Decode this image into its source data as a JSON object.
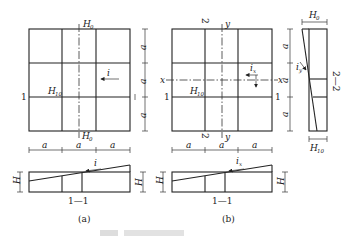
{
  "diagram": {
    "panel_a": {
      "label": "(a)",
      "plan_labels": {
        "top": "H",
        "top_sub": "0",
        "bottom": "H",
        "bottom_sub": "0",
        "center": "H",
        "center_sub": "10",
        "slope": "i",
        "section_mark": "1"
      },
      "dimension": "a",
      "section": {
        "title": "1—1",
        "left": "H",
        "left_sub": "10",
        "right": "H",
        "right_sub": "0",
        "slope": "i"
      }
    },
    "panel_b": {
      "label": "(b)",
      "plan_labels": {
        "axis_x": "x",
        "axis_y": "y",
        "section2": "2",
        "section1": "1",
        "center": "H",
        "center_sub": "10",
        "slope": "i",
        "slope_sub": "x"
      },
      "dimension": "a",
      "section_1_1": {
        "title": "1—1",
        "left": "H",
        "left_sub": "10",
        "right": "H",
        "right_sub": "0",
        "slope": "i",
        "slope_sub": "x"
      },
      "section_2_2": {
        "title": "2—2",
        "top": "H",
        "top_sub": "0",
        "bottom": "H",
        "bottom_sub": "10",
        "slope": "i",
        "slope_sub": "y"
      }
    },
    "caption": ""
  }
}
